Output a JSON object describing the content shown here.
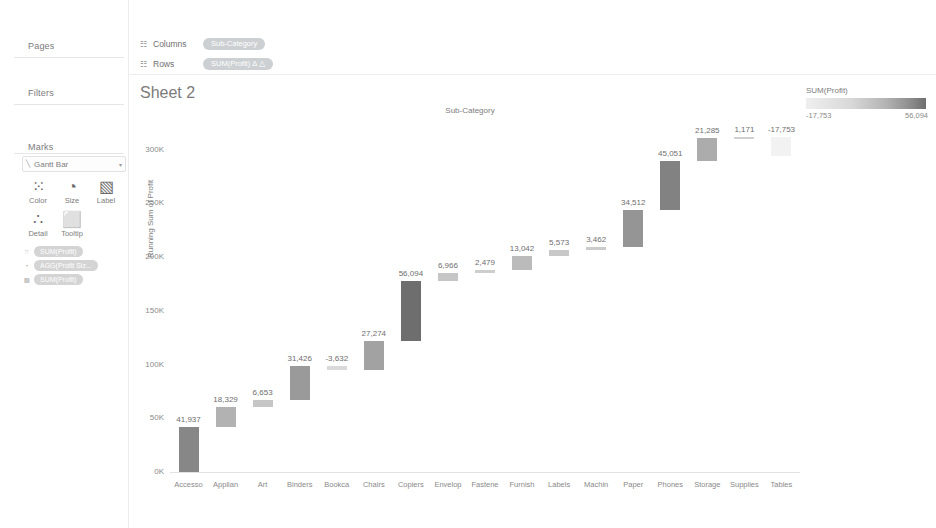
{
  "worksheet": {
    "title": "Sheet 2"
  },
  "left_panel": {
    "pages_label": "Pages",
    "filters_label": "Filters",
    "marks_label": "Marks",
    "mark_type": "Gantt Bar",
    "mark_type_caret": "▾",
    "mark_type_icon": "╲",
    "buttons": [
      {
        "name": "color",
        "label": "Color",
        "glyph": "⁙"
      },
      {
        "name": "size",
        "label": "Size",
        "glyph": "◔"
      },
      {
        "name": "label",
        "label": "Label",
        "glyph": "▧"
      },
      {
        "name": "detail",
        "label": "Detail",
        "glyph": "∴"
      },
      {
        "name": "tooltip",
        "label": "Tooltip",
        "glyph": "⬜"
      }
    ],
    "mark_pills": [
      {
        "glyph": "⁙",
        "text": "SUM(Profit)"
      },
      {
        "glyph": "◔",
        "text": "AGG(Profit Siz..."
      },
      {
        "glyph": "▧",
        "text": "SUM(Profit)"
      }
    ]
  },
  "shelves": {
    "grid_icon": "☷",
    "columns": {
      "name": "Columns",
      "pill": "Sub-Category"
    },
    "rows": {
      "name": "Rows",
      "pill": "SUM(Profit)  Δ  △"
    }
  },
  "legend": {
    "title": "SUM(Profit)",
    "min": "-17,753",
    "max": "56,094",
    "gradient_low": "#efefef",
    "gradient_high": "#6e6e6e"
  },
  "chart_data": {
    "type": "bar",
    "subtype": "waterfall",
    "title": "Sheet 2",
    "column_header": "Sub-Category",
    "xlabel": "",
    "ylabel": "Running Sum of Profit",
    "ylim": [
      0,
      320000
    ],
    "yticks": [
      "0K",
      "50K",
      "100K",
      "150K",
      "200K",
      "250K",
      "300K"
    ],
    "ytick_values": [
      0,
      50000,
      100000,
      150000,
      200000,
      250000,
      300000
    ],
    "grid": false,
    "legend_position": "top-right",
    "categories": [
      "Accesso",
      "Applian",
      "Art",
      "Binders",
      "Bookca",
      "Chairs",
      "Copiers",
      "Envelop",
      "Fastene",
      "Furnish",
      "Labels",
      "Machin",
      "Paper",
      "Phones",
      "Storage",
      "Supplies",
      "Tables"
    ],
    "category_full": [
      "Accessories",
      "Appliances",
      "Art",
      "Binders",
      "Bookcases",
      "Chairs",
      "Copiers",
      "Envelopes",
      "Fasteners",
      "Furnishings",
      "Labels",
      "Machines",
      "Paper",
      "Phones",
      "Storage",
      "Supplies",
      "Tables"
    ],
    "values": [
      41937,
      18329,
      6653,
      31426,
      -3632,
      27274,
      56094,
      6966,
      2479,
      13042,
      5573,
      3462,
      34512,
      45051,
      21285,
      1171,
      -17753
    ],
    "labels": [
      "41,937",
      "18,329",
      "6,653",
      "31,426",
      "-3,632",
      "27,274",
      "56,094",
      "6,966",
      "2,479",
      "13,042",
      "5,573",
      "3,462",
      "34,512",
      "45,051",
      "21,285",
      "1,171",
      "-17,753"
    ],
    "running_start": [
      0,
      41937,
      60266,
      66919,
      98345,
      94713,
      121987,
      178081,
      185047,
      187526,
      200568,
      206141,
      209603,
      244115,
      289166,
      310451,
      311622
    ],
    "running_end": [
      41937,
      60266,
      66919,
      98345,
      94713,
      121987,
      178081,
      185047,
      187526,
      200568,
      206141,
      209603,
      244115,
      289166,
      310451,
      311622,
      293869
    ]
  }
}
